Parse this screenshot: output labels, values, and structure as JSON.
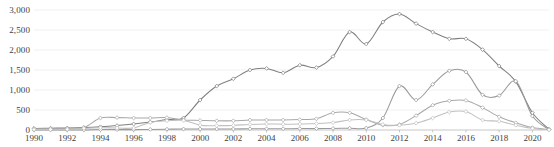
{
  "chart_data": {
    "type": "line",
    "title": "",
    "subtitle": "",
    "xlabel": "",
    "ylabel": "",
    "xlim": [
      1990,
      2021
    ],
    "ylim": [
      0,
      3000
    ],
    "grid": true,
    "grid_axis": "y",
    "legend": "none",
    "markers": true,
    "marker_shape": "diamond",
    "smoothing": "spline",
    "x": [
      1990,
      1991,
      1992,
      1993,
      1994,
      1995,
      1996,
      1997,
      1998,
      1999,
      2000,
      2001,
      2002,
      2003,
      2004,
      2005,
      2006,
      2007,
      2008,
      2009,
      2010,
      2011,
      2012,
      2013,
      2014,
      2015,
      2016,
      2017,
      2018,
      2019,
      2020,
      2021
    ],
    "yticks": [
      0,
      500,
      1000,
      1500,
      2000,
      2500,
      3000
    ],
    "ytick_labels": [
      "0",
      "500",
      "1,000",
      "1,500",
      "2,000",
      "2,500",
      "3,000"
    ],
    "xticks": [
      1990,
      1992,
      1994,
      1996,
      1998,
      2000,
      2002,
      2004,
      2006,
      2008,
      2010,
      2012,
      2014,
      2016,
      2018,
      2020
    ],
    "xtick_labels": [
      "1990",
      "1992",
      "1994",
      "1996",
      "1998",
      "2000",
      "2002",
      "2004",
      "2006",
      "2008",
      "2010",
      "2012",
      "2014",
      "2016",
      "2018",
      "2020"
    ],
    "series": [
      {
        "name": "series-1",
        "color": "#808080",
        "values": [
          40,
          45,
          50,
          60,
          80,
          110,
          150,
          200,
          260,
          300,
          750,
          1100,
          1280,
          1500,
          1540,
          1430,
          1620,
          1560,
          1840,
          2450,
          2150,
          2700,
          2900,
          2660,
          2450,
          2280,
          2280,
          2010,
          1600,
          1210,
          430,
          20
        ]
      },
      {
        "name": "series-2",
        "color": "#9a9a9a",
        "values": [
          0,
          0,
          0,
          0,
          10,
          10,
          10,
          15,
          20,
          25,
          25,
          25,
          25,
          30,
          30,
          30,
          35,
          35,
          40,
          45,
          50,
          300,
          1100,
          750,
          1140,
          1480,
          1450,
          880,
          860,
          1220,
          350,
          10
        ]
      },
      {
        "name": "series-3",
        "color": "#a8a8a8",
        "values": [
          30,
          35,
          40,
          60,
          300,
          310,
          300,
          300,
          310,
          250,
          240,
          230,
          230,
          250,
          250,
          250,
          260,
          280,
          430,
          430,
          260,
          120,
          140,
          360,
          620,
          730,
          740,
          560,
          330,
          180,
          60,
          10
        ]
      },
      {
        "name": "series-4",
        "color": "#c0c0c0",
        "values": [
          10,
          12,
          15,
          40,
          55,
          50,
          50,
          190,
          230,
          240,
          120,
          110,
          115,
          140,
          150,
          145,
          150,
          160,
          185,
          250,
          250,
          140,
          120,
          170,
          300,
          450,
          460,
          250,
          220,
          120,
          40,
          5
        ]
      }
    ]
  },
  "axes": {
    "y_axis_name": "value-axis",
    "x_axis_name": "year-axis"
  }
}
